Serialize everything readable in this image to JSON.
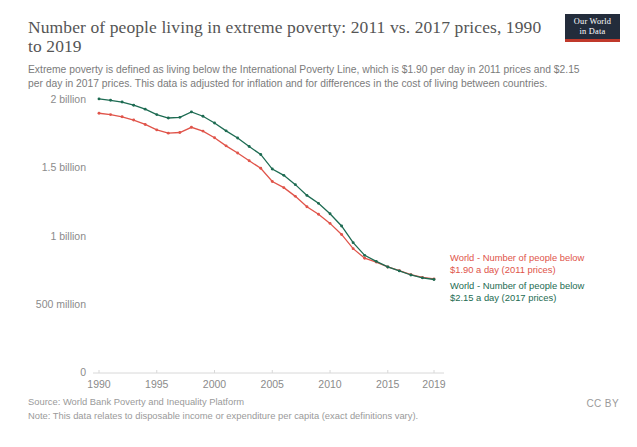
{
  "header": {
    "title": "Number of people living in extreme poverty: 2011 vs. 2017 prices, 1990 to 2019",
    "subtitle": "Extreme poverty is defined as living below the International Poverty Line, which is $1.90 per day in 2011 prices and $2.15 per day in 2017 prices. This data is adjusted for inflation and for differences in the cost of living between countries."
  },
  "logo": {
    "line1": "Our World",
    "line2": "in Data",
    "background": "#232c3b",
    "accent": "#c0392b"
  },
  "footer": {
    "source": "Source: World Bank Poverty and Inequality Platform",
    "note": "Note: This data relates to disposable income or expenditure per capita (exact definitions vary).",
    "license": "CC BY"
  },
  "legend": {
    "series_2011_line1": "World - Number of people below",
    "series_2011_line2": "$1.90 a day (2011 prices)",
    "series_2017_line1": "World - Number of people below",
    "series_2017_line2": "$2.15 a day (2017 prices)"
  },
  "chart_data": {
    "type": "line",
    "title": "Number of people living in extreme poverty: 2011 vs. 2017 prices, 1990 to 2019",
    "subtitle": "Extreme poverty is defined as living below the International Poverty Line, which is $1.90 per day in 2011 prices and $2.15 per day in 2017 prices. This data is adjusted for inflation and for differences in the cost of living between countries.",
    "xlabel": "",
    "ylabel": "",
    "xlim": [
      1990,
      2019
    ],
    "ylim": [
      0,
      2100000000
    ],
    "grid": false,
    "legend_position": "right-inline",
    "x_tick_labels": [
      "1990",
      "1995",
      "2000",
      "2005",
      "2010",
      "2015",
      "2019"
    ],
    "x_ticks": [
      1990,
      1995,
      2000,
      2005,
      2010,
      2015,
      2019
    ],
    "y_tick_labels": [
      "0",
      "500 million",
      "1 billion",
      "1.5 billion",
      "2 billion"
    ],
    "y_ticks": [
      0,
      500000000,
      1000000000,
      1500000000,
      2000000000
    ],
    "x": [
      1990,
      1991,
      1992,
      1993,
      1994,
      1995,
      1996,
      1997,
      1998,
      1999,
      2000,
      2001,
      2002,
      2003,
      2004,
      2005,
      2006,
      2007,
      2008,
      2009,
      2010,
      2011,
      2012,
      2013,
      2014,
      2015,
      2016,
      2017,
      2018,
      2019
    ],
    "series": [
      {
        "name": "World - Number of people below $1.90 a day (2011 prices)",
        "color": "#e0544a",
        "values": [
          1903000000,
          1893000000,
          1877000000,
          1853000000,
          1821000000,
          1781000000,
          1757000000,
          1762000000,
          1800000000,
          1772000000,
          1723000000,
          1664000000,
          1612000000,
          1555000000,
          1500000000,
          1403000000,
          1358000000,
          1294000000,
          1218000000,
          1163000000,
          1096000000,
          1015000000,
          911000000,
          841000000,
          813000000,
          777000000,
          750000000,
          721000000,
          700000000,
          689000000
        ]
      },
      {
        "name": "World - Number of people below $2.15 a day (2017 prices)",
        "color": "#1d6b52",
        "values": [
          2008000000,
          1998000000,
          1985000000,
          1962000000,
          1933000000,
          1893000000,
          1868000000,
          1873000000,
          1913000000,
          1881000000,
          1832000000,
          1774000000,
          1722000000,
          1659000000,
          1601000000,
          1494000000,
          1448000000,
          1380000000,
          1301000000,
          1243000000,
          1167000000,
          1077000000,
          955000000,
          862000000,
          818000000,
          777000000,
          748000000,
          718000000,
          697000000,
          685000000
        ]
      }
    ]
  }
}
